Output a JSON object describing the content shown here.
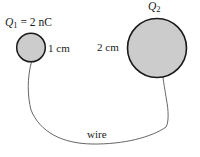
{
  "figure": {
    "background_color": "#ffffff",
    "sphere_fill_color": "#cccccc",
    "stroke_color": "#1a1a1a",
    "wire_color": "#555555",
    "labels": {
      "q1_symbol": "Q",
      "q1_subscript": "1",
      "q1_value_text": "= 2 nC",
      "q1_full": "Q1 = 2 nC",
      "q2_symbol": "Q",
      "q2_subscript": "2",
      "q2_full": "Q2",
      "radius_left": "1 cm",
      "radius_right": "2 cm",
      "wire": "wire"
    },
    "geometry": {
      "small_sphere": {
        "cx": 31,
        "cy": 47.5,
        "r": 14.3,
        "radius_label": "1 cm"
      },
      "large_sphere": {
        "cx": 157,
        "cy": 48,
        "r": 29.5,
        "radius_label": "2 cm"
      },
      "wire_path": "M31.5,61.8 C27,78 27.5,96 31,110 C40,132 62,143.5 92,144 C124,144.5 152,137 166,127 C169,122 168.5,110 166.5,100 C165,90 163.5,82 163,77.3"
    }
  }
}
